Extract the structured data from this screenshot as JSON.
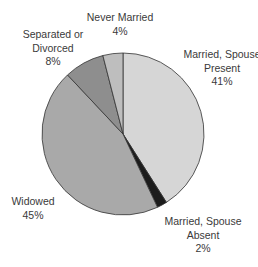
{
  "chart_data": {
    "type": "pie",
    "title": "",
    "start_angle_deg": 0,
    "direction": "clockwise",
    "slices": [
      {
        "label": "Married, Spouse Present",
        "value": 41,
        "display": "41%",
        "color": "#d6d6d6"
      },
      {
        "label": "Married, Spouse Absent",
        "value": 2,
        "display": "2%",
        "color": "#1c1c1c"
      },
      {
        "label": "Widowed",
        "value": 45,
        "display": "45%",
        "color": "#a9a9a9"
      },
      {
        "label": "Separated or Divorced",
        "value": 8,
        "display": "8%",
        "color": "#8e8e8e"
      },
      {
        "label": "Never Married",
        "value": 4,
        "display": "4%",
        "color": "#bebebe"
      }
    ],
    "legend": "none (direct labels)"
  },
  "labels": {
    "married_present": {
      "line1": "Married, Spouse",
      "line2": "Present",
      "pct": "41%"
    },
    "married_absent": {
      "line1": "Married, Spouse",
      "line2": "Absent",
      "pct": "2%"
    },
    "widowed": {
      "line1": "Widowed",
      "pct": "45%"
    },
    "separated": {
      "line1": "Separated or",
      "line2": "Divorced",
      "pct": "8%"
    },
    "never_married": {
      "line1": "Never Married",
      "pct": "4%"
    }
  }
}
